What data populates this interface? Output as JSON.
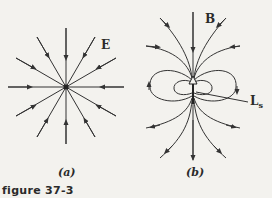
{
  "figure": {
    "caption": "figure 37-3",
    "panels": [
      {
        "id": "a",
        "label": "(a)",
        "field_label": "E",
        "description": "radial electric field lines converging on a point charge"
      },
      {
        "id": "b",
        "label": "(b)",
        "field_label": "B",
        "vector_label": "L",
        "vector_subscript": "s",
        "description": "dipole magnetic field lines around a spin angular momentum vector"
      }
    ]
  }
}
